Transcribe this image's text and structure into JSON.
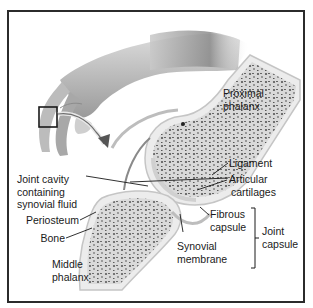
{
  "figure": {
    "colors": {
      "frame": "#2b2b2b",
      "bone_fill": "#e6e6e6",
      "spongy_bone": "#6a6a6a",
      "cartilage": "#d2d2d2",
      "capsule": "#bdbdbd",
      "leader_line": "#1a1a1a",
      "label_text": "#1a1a1a"
    }
  },
  "labels": {
    "proximal_phalanx": [
      "Proximal",
      "phalanx"
    ],
    "joint_cavity": [
      "Joint cavity",
      "containing",
      "synovial fluid"
    ],
    "ligament": "Ligament",
    "articular_cartilages": [
      "Articular",
      "cartilages"
    ],
    "periosteum": "Periosteum",
    "bone": "Bone",
    "fibrous_capsule": [
      "Fibrous",
      "capsule"
    ],
    "synovial_membrane": [
      "Synovial",
      "membrane"
    ],
    "joint_capsule": [
      "Joint",
      "capsule"
    ],
    "middle_phalanx": [
      "Middle",
      "phalanx"
    ]
  },
  "icons": {
    "hand": "hand-illustration",
    "inset_box": "magnify-inset-box",
    "arrow": "curved-arrow-icon"
  }
}
